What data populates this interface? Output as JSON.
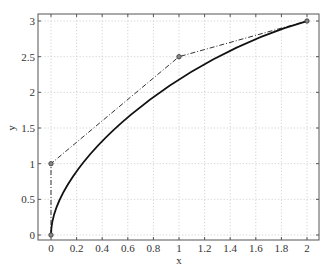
{
  "chart_data": {
    "type": "line",
    "title": "",
    "xlabel": "x",
    "ylabel": "y",
    "xlim": [
      -0.1,
      2.1
    ],
    "ylim": [
      -0.075,
      3.1
    ],
    "grid": true,
    "legend": null,
    "xticks": [
      0,
      0.2,
      0.4,
      0.6,
      0.8,
      1,
      1.2,
      1.4,
      1.6,
      1.8,
      2
    ],
    "xtick_labels": [
      "0",
      "0.2",
      "0.4",
      "0.6",
      "0.8",
      "1",
      "1.2",
      "1.4",
      "1.6",
      "1.8",
      "2"
    ],
    "yticks": [
      0,
      0.5,
      1,
      1.5,
      2,
      2.5,
      3
    ],
    "ytick_labels": [
      "0",
      "0.5",
      "1",
      "1.5",
      "2",
      "2.5",
      "3"
    ],
    "series": [
      {
        "name": "control polygon",
        "style": "dash-dot with circle markers",
        "color": "#333333",
        "x": [
          0,
          0,
          1,
          2
        ],
        "y": [
          0,
          1,
          2.5,
          3
        ]
      },
      {
        "name": "Bezier curve",
        "style": "solid",
        "color": "#111111",
        "control_points": [
          [
            0,
            0
          ],
          [
            0,
            1
          ],
          [
            1,
            2.5
          ],
          [
            2,
            3
          ]
        ],
        "x": [
          0,
          0.028,
          0.104,
          0.216,
          0.352,
          0.5,
          0.648,
          0.784,
          0.896,
          0.972,
          1.0,
          1.252,
          1.5,
          1.744,
          2.0
        ],
        "y": [
          0,
          0.54,
          1.0,
          1.37,
          1.67,
          1.9,
          2.09,
          2.24,
          2.36,
          2.45,
          2.48,
          2.66,
          2.8,
          2.92,
          3.0
        ]
      }
    ]
  }
}
